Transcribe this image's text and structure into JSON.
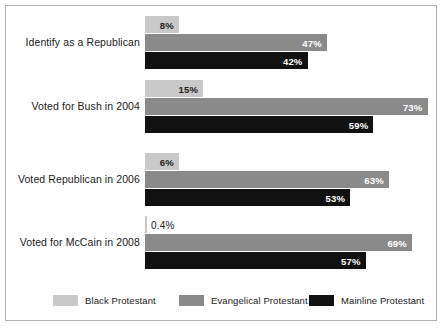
{
  "chart_data": {
    "type": "bar",
    "orientation": "horizontal",
    "title": "",
    "xlabel": "",
    "ylabel": "",
    "xlim": [
      0,
      100
    ],
    "grid": false,
    "legend_position": "bottom",
    "categories": [
      "Identify as a Republican",
      "Voted for Bush in 2004",
      "Voted Republican in 2006",
      "Voted for McCain in 2008"
    ],
    "series": [
      {
        "name": "Black Protestant",
        "color": "#c9c9c9",
        "values": [
          8,
          15,
          6,
          0.4
        ],
        "labels": [
          "8%",
          "15%",
          "6%",
          "0.4%"
        ]
      },
      {
        "name": "Evangelical Protestant",
        "color": "#8a8a8a",
        "values": [
          47,
          73,
          63,
          69
        ],
        "labels": [
          "47%",
          "73%",
          "63%",
          "69%"
        ]
      },
      {
        "name": "Mainline Protestant",
        "color": "#111111",
        "values": [
          42,
          59,
          53,
          57
        ],
        "labels": [
          "42%",
          "59%",
          "53%",
          "57%"
        ]
      }
    ]
  },
  "legend": {
    "items": [
      {
        "label": "Black Protestant",
        "color": "#c9c9c9"
      },
      {
        "label": "Evangelical Protestant",
        "color": "#8a8a8a"
      },
      {
        "label": "Mainline Protestant",
        "color": "#111111"
      }
    ]
  }
}
